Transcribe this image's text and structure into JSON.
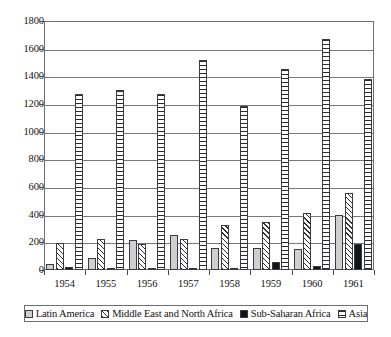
{
  "chart_data": {
    "type": "bar",
    "title": "",
    "subtitle": "",
    "xlabel": "",
    "ylabel": "",
    "categories": [
      "1954",
      "1955",
      "1956",
      "1957",
      "1958",
      "1959",
      "1960",
      "1961"
    ],
    "series": [
      {
        "name": "Latin America",
        "swatch": "solid-light-gray",
        "color": "#cfcfcf",
        "values": [
          45,
          90,
          215,
          255,
          160,
          160,
          150,
          400
        ]
      },
      {
        "name": "Middle East and North Africa",
        "swatch": "diagonal-hatch",
        "color": "#2f2f36",
        "values": [
          195,
          225,
          190,
          225,
          325,
          345,
          410,
          555
        ]
      },
      {
        "name": "Sub-Saharan Africa",
        "swatch": "solid-black",
        "color": "#141418",
        "values": [
          25,
          10,
          5,
          15,
          5,
          60,
          30,
          190
        ]
      },
      {
        "name": "Asia",
        "swatch": "horizontal-stripes",
        "color": "#2a2a31",
        "values": [
          1270,
          1300,
          1270,
          1520,
          1185,
          1455,
          1670,
          1380
        ]
      }
    ],
    "ylim": [
      0,
      1800
    ],
    "yticks": [
      0,
      200,
      400,
      600,
      800,
      1000,
      1200,
      1400,
      1600,
      1800
    ],
    "ytick_labels": [
      "0",
      "200",
      "400",
      "600",
      "800",
      "1000",
      "1200",
      "1400",
      "1600",
      "1800"
    ],
    "grid": true,
    "grid_axis": "y",
    "legend_position": "bottom",
    "plot_background": "#ffffff",
    "frame_color": "#6d6d78"
  }
}
